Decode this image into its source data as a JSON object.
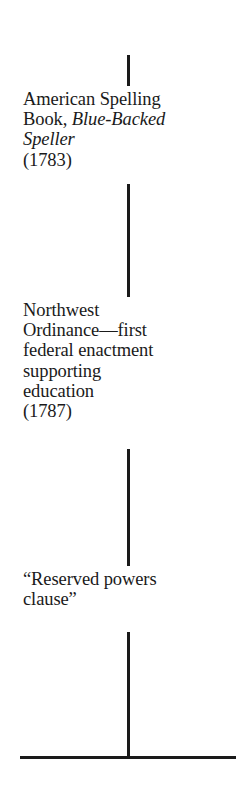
{
  "timeline": {
    "connectors": [
      {
        "top": 55,
        "height": 31
      },
      {
        "top": 184,
        "height": 113
      },
      {
        "top": 449,
        "height": 117
      },
      {
        "top": 632,
        "height": 125
      }
    ],
    "events": [
      {
        "id": "american-spelling-book",
        "lines": [
          {
            "text": "American Spelling"
          },
          {
            "prefix": "Book, ",
            "italic": "Blue-Backed"
          },
          {
            "italic": "Speller"
          },
          {
            "text": "(1783)"
          }
        ]
      },
      {
        "id": "northwest-ordinance",
        "lines": [
          {
            "text": "Northwest"
          },
          {
            "text": "Ordinance—first"
          },
          {
            "text": "federal enactment"
          },
          {
            "text": "supporting"
          },
          {
            "text": "education"
          },
          {
            "text": "(1787)"
          }
        ]
      },
      {
        "id": "reserved-powers-clause",
        "lines": [
          {
            "text": "“Reserved powers"
          },
          {
            "text": "clause”"
          }
        ]
      }
    ],
    "colors": {
      "ink": "#1a1a1a",
      "background": "#ffffff"
    }
  }
}
